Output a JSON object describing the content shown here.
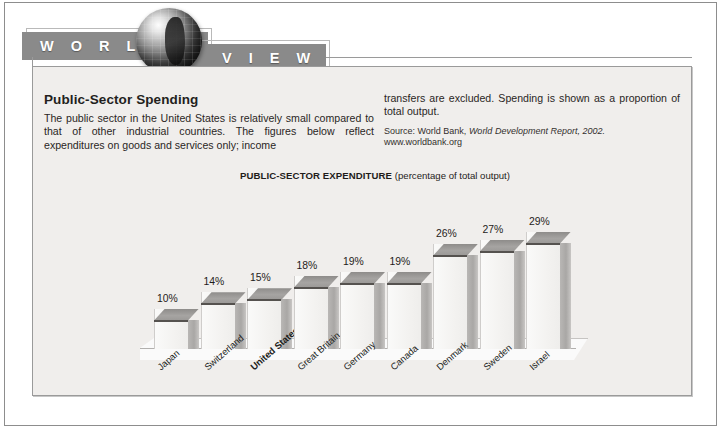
{
  "banner": {
    "word_left": "W O R L D",
    "word_right": "V I E W",
    "globe_icon": "globe-icon"
  },
  "article": {
    "headline": "Public-Sector Spending",
    "body_left": "The public sector in the United States is relatively small compared to that of other industrial countries. The figures below reflect expenditures on goods and services only; income",
    "body_right": "transfers are excluded. Spending is shown as a proportion of total output.",
    "source_prefix": "Source: World Bank, ",
    "source_italic": "World Development Report, 2002.",
    "source_url": "www.worldbank.org"
  },
  "chart_data": {
    "type": "bar",
    "title": "PUBLIC-SECTOR EXPENDITURE",
    "subtitle": "(percentage of total output)",
    "xlabel": "",
    "ylabel": "",
    "ylim": [
      0,
      30
    ],
    "grid": false,
    "legend": null,
    "categories": [
      "Japan",
      "Switzerland",
      "United States",
      "Great Britain",
      "Germany",
      "Canada",
      "Denmark",
      "Sweden",
      "Israel"
    ],
    "values": [
      10,
      14,
      15,
      18,
      19,
      19,
      26,
      27,
      29
    ],
    "data_labels": [
      "10%",
      "14%",
      "15%",
      "18%",
      "19%",
      "19%",
      "26%",
      "27%",
      "29%"
    ],
    "highlighted_category": "United States",
    "colors": {
      "bar_front": "#f4f3f1",
      "bar_top": "#9a9896",
      "bar_side": "#b2b0ae",
      "panel_bg": "#f0eeec",
      "banner_bar": "#8a8a8a"
    }
  }
}
